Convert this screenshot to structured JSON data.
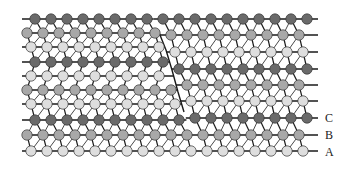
{
  "diagram": {
    "colors": {
      "C": "#6a6a6a",
      "B": "#a8a8a8",
      "A": "#dedede",
      "bond": "#1a1a1a",
      "atom_stroke": "#333333"
    },
    "atom_spacing": 16,
    "atom_radius": 5.2,
    "fault_line": [
      [
        158,
        30
      ],
      [
        166,
        50
      ],
      [
        172,
        70
      ],
      [
        178,
        92
      ],
      [
        184,
        112
      ]
    ],
    "left_rows": [
      {
        "y": 19,
        "layer": "C",
        "x0": 35
      },
      {
        "y": 33,
        "layer": "B",
        "x0": 27
      },
      {
        "y": 47,
        "layer": "A",
        "x0": 31
      },
      {
        "y": 62,
        "layer": "C",
        "x0": 35
      },
      {
        "y": 76,
        "layer": "A",
        "x0": 31
      },
      {
        "y": 90,
        "layer": "B",
        "x0": 27
      },
      {
        "y": 104,
        "layer": "A",
        "x0": 31
      },
      {
        "y": 120,
        "layer": "C",
        "x0": 35
      },
      {
        "y": 135,
        "layer": "B",
        "x0": 27
      },
      {
        "y": 151,
        "layer": "A",
        "x0": 31
      }
    ],
    "right_rows": [
      {
        "y": 19,
        "layer": "C",
        "x0": 35
      },
      {
        "y": 35,
        "layer": "B",
        "x0": 27
      },
      {
        "y": 52,
        "layer": "A",
        "x0": 31
      },
      {
        "y": 69,
        "layer": "C",
        "x0": 35
      },
      {
        "y": 85,
        "layer": "B",
        "x0": 27
      },
      {
        "y": 101,
        "layer": "A",
        "x0": 31
      },
      {
        "y": 118,
        "layer": "C",
        "x0": 35
      },
      {
        "y": 135,
        "layer": "B",
        "x0": 27
      },
      {
        "y": 151,
        "layer": "A",
        "x0": 31
      }
    ],
    "x_min": 22,
    "x_max": 318,
    "layer_labels": [
      {
        "text": "C",
        "x": 325,
        "y": 111
      },
      {
        "text": "B",
        "x": 325,
        "y": 128
      },
      {
        "text": "A",
        "x": 325,
        "y": 145
      }
    ]
  }
}
